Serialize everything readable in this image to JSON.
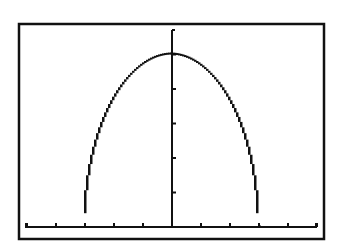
{
  "chart_data": {
    "type": "line",
    "title": "",
    "xlabel": "",
    "ylabel": "",
    "series": [
      {
        "name": "y = 5·sqrt(1 - x²/9)",
        "x": [
          -3,
          -2.9,
          -2.75,
          -2.5,
          -2.25,
          -2,
          -1.75,
          -1.5,
          -1.25,
          -1,
          -0.75,
          -0.5,
          -0.25,
          0,
          0.25,
          0.5,
          0.75,
          1,
          1.25,
          1.5,
          1.75,
          2,
          2.25,
          2.5,
          2.75,
          2.9,
          3
        ],
        "values": [
          0.4,
          1.28,
          2.0,
          2.76,
          3.31,
          3.73,
          4.06,
          4.33,
          4.55,
          4.71,
          4.84,
          4.93,
          4.98,
          5.0,
          4.98,
          4.93,
          4.84,
          4.71,
          4.55,
          4.33,
          4.06,
          3.73,
          3.31,
          2.76,
          2.0,
          1.28,
          0.4
        ]
      }
    ],
    "xlim": [
      -5.3,
      5.3
    ],
    "ylim": [
      0,
      5.7
    ],
    "x_ticks": [
      -5,
      -4,
      -3,
      -2,
      -1,
      1,
      2,
      3,
      4,
      5
    ],
    "y_ticks": [
      1,
      2,
      3,
      4,
      5
    ],
    "grid": false,
    "legend": "none",
    "style": "graphing-calculator pixel plot, black on white"
  },
  "colors": {
    "background": "#ffffff",
    "ink": "#111111"
  }
}
